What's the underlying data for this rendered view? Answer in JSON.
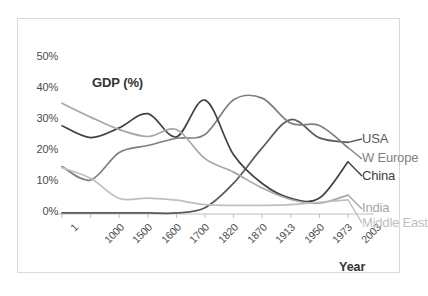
{
  "chart_data": {
    "type": "line",
    "title": "",
    "ylabel": "GDP (%)",
    "xlabel": "Year",
    "categories": [
      "1",
      "1000",
      "1500",
      "1600",
      "1700",
      "1820",
      "1870",
      "1913",
      "1950",
      "1973",
      "2003"
    ],
    "ytick_labels": [
      "0%",
      "10%",
      "20%",
      "30%",
      "40%",
      "50%"
    ],
    "ytick_values": [
      0,
      10,
      20,
      30,
      40,
      50
    ],
    "ylim": [
      0,
      50
    ],
    "grid": false,
    "legend_position": "right-inline",
    "series": [
      {
        "name": "USA",
        "color": "#595959",
        "values": [
          0.3,
          0.3,
          0.3,
          0.3,
          0.3,
          1.8,
          8.9,
          19.1,
          27.3,
          22.0,
          20.7
        ]
      },
      {
        "name": "W Europe",
        "color": "#7f7f7f",
        "values": [
          13.7,
          9.8,
          17.8,
          19.8,
          21.9,
          23.0,
          33.0,
          33.5,
          26.2,
          25.6,
          19.2
        ]
      },
      {
        "name": "China",
        "color": "#404040",
        "values": [
          25.5,
          22.1,
          24.9,
          29.0,
          22.3,
          32.9,
          17.1,
          8.8,
          4.5,
          4.6,
          15.1
        ]
      },
      {
        "name": "India",
        "color": "#a6a6a6",
        "values": [
          32.0,
          28.0,
          24.4,
          22.4,
          24.4,
          16.0,
          12.1,
          7.5,
          4.2,
          3.1,
          5.5
        ]
      },
      {
        "name": "Middle East",
        "color": "#bfbfbf",
        "values": [
          13.4,
          10.3,
          4.5,
          4.6,
          4.0,
          2.7,
          2.5,
          2.5,
          2.7,
          3.4,
          4.1
        ]
      }
    ]
  },
  "frame": {
    "border_color": "#d9d9d9",
    "background": "#ffffff"
  },
  "axis": {
    "line_color": "#bfbfbf",
    "tick_color": "#bfbfbf"
  }
}
